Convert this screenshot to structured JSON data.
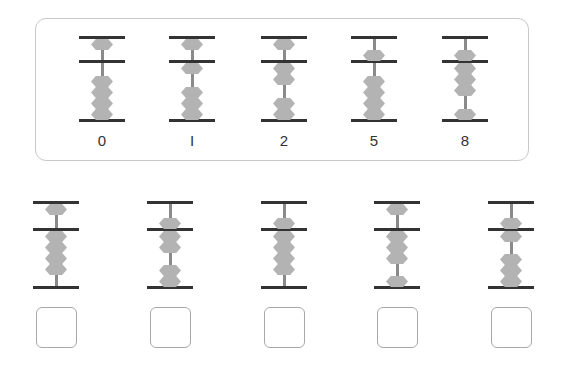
{
  "examples": {
    "title": "",
    "items": [
      {
        "label": "0",
        "value": 0
      },
      {
        "label": "I",
        "value": 1
      },
      {
        "label": "2",
        "value": 2
      },
      {
        "label": "5",
        "value": 5
      },
      {
        "label": "8",
        "value": 8
      }
    ]
  },
  "exercises": {
    "items": [
      {
        "value": 4,
        "answer": ""
      },
      {
        "value": 7,
        "answer": ""
      },
      {
        "value": 9,
        "answer": ""
      },
      {
        "value": 3,
        "answer": ""
      },
      {
        "value": 6,
        "answer": ""
      }
    ]
  },
  "colors": {
    "rail": "#333333",
    "rod": "#8a8a8a",
    "bead": "#b3b3b3",
    "card_border": "#c8c8c8",
    "box_border": "#a8a8a8",
    "label": "#333333"
  }
}
